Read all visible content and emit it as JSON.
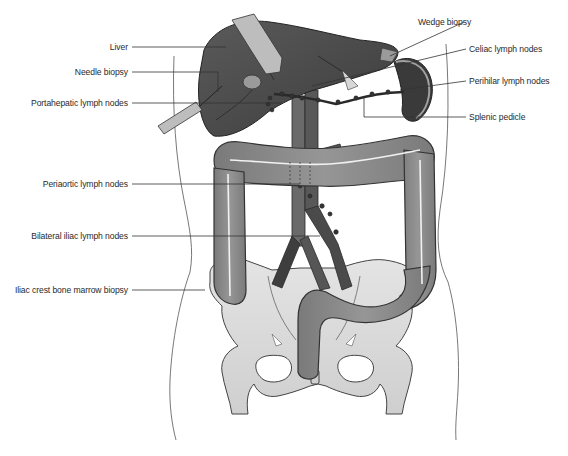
{
  "figure": {
    "type": "anatomical-illustration",
    "colors": {
      "liver": "#4a4a4a",
      "spleen": "#3a3a3a",
      "colon": "#8c8c8c",
      "colon_outline": "#3c3c3c",
      "bone": "#d9d9d9",
      "vessels": "#5a5a5a",
      "body_outline": "#555555",
      "leader_line": "#333333",
      "label_text": "#2a2a2a"
    }
  },
  "labels": {
    "left": [
      {
        "id": "liver",
        "text": "Liver"
      },
      {
        "id": "needle_biopsy",
        "text": "Needle biopsy"
      },
      {
        "id": "portahepatic",
        "text": "Portahepatic lymph nodes"
      },
      {
        "id": "periaortic",
        "text": "Periaortic lymph nodes"
      },
      {
        "id": "bilateral_iliac",
        "text": "Bilateral iliac lymph nodes"
      },
      {
        "id": "iliac_crest",
        "text": "Iliac crest bone marrow biopsy"
      }
    ],
    "right": [
      {
        "id": "wedge_biopsy",
        "text": "Wedge biopsy"
      },
      {
        "id": "celiac",
        "text": "Celiac lymph nodes"
      },
      {
        "id": "perihilar",
        "text": "Perihilar lymph nodes"
      },
      {
        "id": "splenic_pedicle",
        "text": "Splenic pedicle"
      }
    ]
  }
}
